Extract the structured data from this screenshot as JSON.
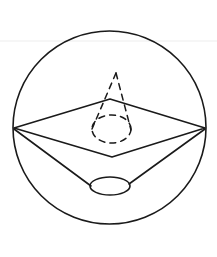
{
  "figure": {
    "title": "Cone inscribed in sphere with rhombus cross-section",
    "canvas": {
      "width": 217,
      "height": 257,
      "background": "#ffffff"
    },
    "stroke": {
      "solid_color": "#1a1a1a",
      "dashed_color": "#1a1a1a",
      "faint_color": "#ededed",
      "solid_width": 1.6,
      "dashed_width": 1.5,
      "faint_width": 1.2,
      "dash_pattern": "6 5"
    },
    "shapes": {
      "outer_circle": {
        "name": "sphere-outline",
        "cx": 109.5,
        "cy": 127.5,
        "r": 96.5,
        "style": "solid"
      },
      "rhombus": {
        "name": "rhombus-cross-section",
        "points": "14,128 110,99 205,128 112,157",
        "style": "solid"
      },
      "lower_cone_left_edge": {
        "name": "lower-cone-left-edge",
        "x1": 14,
        "y1": 129,
        "x2": 91,
        "y2": 186,
        "style": "solid"
      },
      "lower_cone_right_edge": {
        "name": "lower-cone-right-edge",
        "x1": 205,
        "y1": 129,
        "x2": 129,
        "y2": 184,
        "style": "solid"
      },
      "lower_ellipse": {
        "name": "lower-cone-base-ellipse",
        "cx": 110,
        "cy": 186,
        "rx": 20,
        "ry": 9,
        "style": "solid"
      },
      "upper_cone_apex": {
        "name": "upper-cone-apex",
        "x": 116,
        "y": 73
      },
      "upper_cone_left_edge": {
        "name": "upper-cone-left-edge-dashed",
        "x1": 116,
        "y1": 73,
        "x2": 92,
        "y2": 129,
        "style": "dashed"
      },
      "upper_cone_right_edge": {
        "name": "upper-cone-right-edge-dashed",
        "x1": 116,
        "y1": 73,
        "x2": 131,
        "y2": 130,
        "style": "dashed"
      },
      "upper_ellipse": {
        "name": "upper-cone-base-ellipse-dashed",
        "cx": 111.5,
        "cy": 129,
        "rx": 19.5,
        "ry": 14,
        "style": "dashed"
      },
      "faint_guide_line": {
        "name": "faint-horizontal-guide",
        "x1": 0,
        "y1": 41,
        "x2": 217,
        "y2": 41,
        "style": "faint"
      }
    }
  }
}
